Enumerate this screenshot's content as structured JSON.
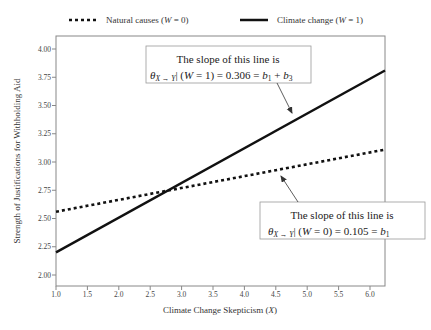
{
  "legend": {
    "items": [
      {
        "label": "Natural causes (",
        "var": "W",
        "suffix": " = 0)",
        "style": "dotted"
      },
      {
        "label": "Climate change (",
        "var": "W",
        "suffix": " = 1)",
        "style": "solid"
      }
    ]
  },
  "annotations": {
    "top": {
      "line1": "The slope of this line is",
      "line2_pre": "| (",
      "line2_var": "W",
      "line2_post": " = 1) = 0.306 = ",
      "formula": "b1 + b3"
    },
    "bottom": {
      "line1": "The slope of this line is",
      "line2_pre": "| (",
      "line2_var": "W",
      "line2_post": " = 0) = 0.105 = ",
      "formula": "b1"
    },
    "theta_symbol": "θ",
    "theta_sub": "X → Y"
  },
  "chart_data": {
    "type": "line",
    "title": "",
    "xlabel": "Climate Change Skepticism (X)",
    "ylabel": "Strength of Justifications for  Withholding Aid",
    "xlim": [
      1.0,
      6.25
    ],
    "ylim": [
      1.9,
      4.12
    ],
    "x_ticks": [
      "1.0",
      "1.5",
      "2.0",
      "2.5",
      "3.0",
      "3.5",
      "4.0",
      "4.5",
      "5.0",
      "5.5",
      "6.0"
    ],
    "y_ticks": [
      "2.00",
      "2.25",
      "2.50",
      "2.75",
      "3.00",
      "3.25",
      "3.50",
      "3.75",
      "4.00"
    ],
    "grid": false,
    "legend_position": "top",
    "series": [
      {
        "name": "Natural causes (W = 0)",
        "style": "dotted",
        "slope": 0.105,
        "x": [
          1.0,
          6.25
        ],
        "y": [
          2.56,
          3.11
        ]
      },
      {
        "name": "Climate change (W = 1)",
        "style": "solid",
        "slope": 0.306,
        "x": [
          1.0,
          6.25
        ],
        "y": [
          2.2,
          3.81
        ]
      }
    ],
    "annotations": [
      "The slope of this line is θX→Y | (W = 1) = 0.306 = b1 + b3",
      "The slope of this line is θX→Y | (W = 0) = 0.105 = b1"
    ]
  }
}
